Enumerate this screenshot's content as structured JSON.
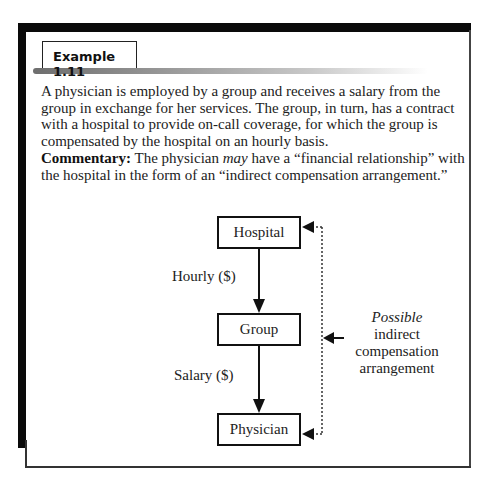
{
  "example": {
    "tab_label": "Example 1.11",
    "paragraph": "A physician is employed by a group and receives a salary from the group in exchange for her services. The group, in turn, has a contract with a hospital to provide on-call coverage, for which the group is compensated by the hospital on an hourly basis.",
    "commentary": {
      "label": "Commentary:",
      "text_before": " The physician ",
      "emphasis": "may",
      "text_after": " have a “financial relationship” with the hospital in the form of an “indirect compensation arrangement.”"
    }
  },
  "diagram": {
    "nodes": [
      {
        "id": "hospital",
        "label": "Hospital"
      },
      {
        "id": "group",
        "label": "Group"
      },
      {
        "id": "physician",
        "label": "Physician"
      }
    ],
    "edges": [
      {
        "from": "hospital",
        "to": "group",
        "label": "Hourly ($)"
      },
      {
        "from": "group",
        "to": "physician",
        "label": "Salary ($)"
      }
    ],
    "possible_link": {
      "emphasis": "Possible",
      "lines": [
        "indirect",
        "compensation",
        "arrangement"
      ]
    }
  }
}
